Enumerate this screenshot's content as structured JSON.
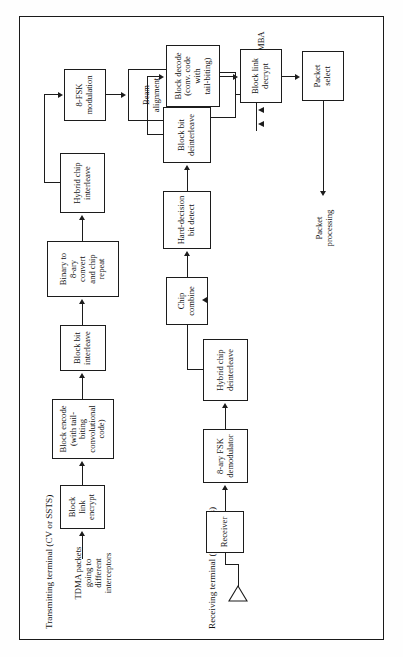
{
  "figure": {
    "orientation": "rotated-90-ccw",
    "line_color": "#1c1c1c",
    "background": "#ffffff"
  },
  "sections": {
    "transmit_caption": "Transmitting terminal (CV or SSTS)",
    "receive_caption": "Receiving terminal (interceptors)"
  },
  "transmit": {
    "input_label": "TDMA packets\ngoing to\ndifferent\ninterceptors",
    "blocks": [
      {
        "id": "block-link-encrypt",
        "label": "Block\nlink\nencrypt"
      },
      {
        "id": "block-encode",
        "label": "Block encode\n(with tail-\nbiting\nconvolutional\ncode)"
      },
      {
        "id": "block-bit-interleave",
        "label": "Block bit\ninterleave"
      },
      {
        "id": "binary-to-8ary",
        "label": "Binary to\n8-ary\nconvert\nand chip\nrepeat"
      },
      {
        "id": "hybrid-chip-interleave",
        "label": "Hybrid chip\ninterleave"
      },
      {
        "id": "8fsk-modulation",
        "label": "8-FSK\nmodulation"
      },
      {
        "id": "beam-alignment",
        "label": "Beam\nalignment"
      },
      {
        "id": "tx",
        "label": "TX"
      }
    ],
    "antenna": {
      "caption": "MBA",
      "element_glyph": "∧",
      "ellipsis": "· · ·"
    }
  },
  "receive": {
    "blocks": [
      {
        "id": "receiver",
        "label": "Receiver"
      },
      {
        "id": "8ary-fsk-demodulator",
        "label": "8-ary FSK\ndemodulator"
      },
      {
        "id": "hybrid-chip-deinterleave",
        "label": "Hybrid chip\ndeinterleave"
      },
      {
        "id": "chip-combine",
        "label": "Chip\ncombine"
      },
      {
        "id": "hard-decision-bit-detect",
        "label": "Hard-decision\nbit detect"
      },
      {
        "id": "block-bit-deinterleave",
        "label": "Block bit\ndeinterleave"
      },
      {
        "id": "block-decode",
        "label": "Block decode\n(conv. code with\ntail-biting)"
      },
      {
        "id": "block-link-decrypt",
        "label": "Block link\ndecrypt"
      },
      {
        "id": "packet-select",
        "label": "Packet\nselect"
      }
    ],
    "output_label": "Packet\nprocessing"
  }
}
